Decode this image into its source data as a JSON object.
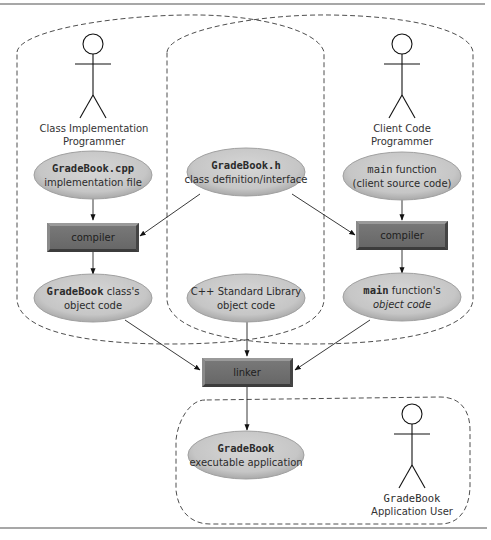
{
  "diagram": {
    "type": "compilation-and-linking-process",
    "colors": {
      "ellipse_fill": "#c9c9c9",
      "ellipse_highlight": "#dcdcdc",
      "box_fill": "#6e6e6e",
      "box_light_edge": "#9a9a9a",
      "box_dark_edge": "#3c3c3c",
      "rule_line": "#8a8a8a"
    },
    "actors": {
      "class_impl": {
        "line1": "Class Implementation",
        "line2": "Programmer"
      },
      "client": {
        "line1": "Client Code",
        "line2": "Programmer"
      },
      "user": {
        "line1": "GradeBook",
        "line2": "Application User"
      }
    },
    "nodes": {
      "gradebook_cpp": {
        "code": "GradeBook.cpp",
        "text": "implementation file"
      },
      "gradebook_h": {
        "code": "GradeBook.h",
        "text": "class definition/interface"
      },
      "main_source": {
        "code": "main",
        "text_inline": " function",
        "text": "(client source code)"
      },
      "compiler_left": {
        "label": "compiler"
      },
      "compiler_right": {
        "label": "compiler"
      },
      "gradebook_obj": {
        "code": "GradeBook",
        "text_inline": " class's",
        "text": "object code"
      },
      "stdlib_obj": {
        "line1": "C++ Standard Library",
        "text": "object code"
      },
      "main_obj": {
        "code": "main",
        "text_inline": " function's",
        "text": "object code"
      },
      "linker": {
        "label": "linker"
      },
      "executable": {
        "code": "GradeBook",
        "text": "executable application"
      }
    },
    "edges": [
      {
        "from": "gradebook_cpp",
        "to": "compiler_left"
      },
      {
        "from": "gradebook_h",
        "to": "compiler_left"
      },
      {
        "from": "gradebook_h",
        "to": "compiler_right"
      },
      {
        "from": "main_source",
        "to": "compiler_right"
      },
      {
        "from": "compiler_left",
        "to": "gradebook_obj"
      },
      {
        "from": "compiler_right",
        "to": "main_obj"
      },
      {
        "from": "gradebook_obj",
        "to": "linker"
      },
      {
        "from": "stdlib_obj",
        "to": "linker"
      },
      {
        "from": "main_obj",
        "to": "linker"
      },
      {
        "from": "linker",
        "to": "executable"
      }
    ],
    "regions": [
      {
        "name": "class-implementation-region"
      },
      {
        "name": "client-code-region"
      },
      {
        "name": "application-user-region"
      }
    ]
  }
}
